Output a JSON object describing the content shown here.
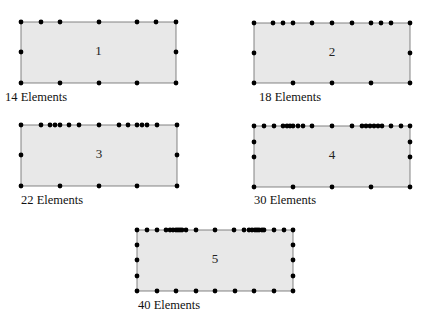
{
  "figure": {
    "panels": [
      {
        "id": 1,
        "label": "1",
        "caption": "14 Elements",
        "element_count": 14,
        "rect": {
          "x": 21,
          "y": 22,
          "w": 155,
          "h": 61
        },
        "caption_pos": {
          "x": 5,
          "y": 92
        },
        "nodes": [
          [
            21,
            22
          ],
          [
            41,
            22
          ],
          [
            60,
            22
          ],
          [
            99,
            22
          ],
          [
            137,
            22
          ],
          [
            156,
            22
          ],
          [
            176,
            22
          ],
          [
            21,
            52
          ],
          [
            176,
            52
          ],
          [
            21,
            83
          ],
          [
            60,
            83
          ],
          [
            99,
            83
          ],
          [
            137,
            83
          ],
          [
            176,
            83
          ]
        ]
      },
      {
        "id": 2,
        "label": "2",
        "caption": "18 Elements",
        "element_count": 18,
        "rect": {
          "x": 254,
          "y": 23,
          "w": 156,
          "h": 60
        },
        "caption_pos": {
          "x": 259,
          "y": 92
        },
        "nodes": [
          [
            254,
            23
          ],
          [
            273,
            23
          ],
          [
            283,
            23
          ],
          [
            293,
            23
          ],
          [
            312,
            23
          ],
          [
            332,
            23
          ],
          [
            352,
            23
          ],
          [
            371,
            23
          ],
          [
            381,
            23
          ],
          [
            391,
            23
          ],
          [
            410,
            23
          ],
          [
            254,
            53
          ],
          [
            410,
            53
          ],
          [
            254,
            83
          ],
          [
            293,
            83
          ],
          [
            332,
            83
          ],
          [
            371,
            83
          ],
          [
            410,
            83
          ]
        ]
      },
      {
        "id": 3,
        "label": "3",
        "caption": "22 Elements",
        "element_count": 22,
        "rect": {
          "x": 21,
          "y": 125,
          "w": 156,
          "h": 61
        },
        "caption_pos": {
          "x": 21,
          "y": 195
        },
        "nodes": [
          [
            21,
            125
          ],
          [
            41,
            125
          ],
          [
            50,
            125
          ],
          [
            55,
            125
          ],
          [
            60,
            125
          ],
          [
            69,
            125
          ],
          [
            79,
            125
          ],
          [
            99,
            125
          ],
          [
            119,
            125
          ],
          [
            128,
            125
          ],
          [
            137,
            125
          ],
          [
            142,
            125
          ],
          [
            147,
            125
          ],
          [
            157,
            125
          ],
          [
            177,
            125
          ],
          [
            21,
            155
          ],
          [
            177,
            155
          ],
          [
            21,
            186
          ],
          [
            60,
            186
          ],
          [
            99,
            186
          ],
          [
            137,
            186
          ],
          [
            177,
            186
          ]
        ]
      },
      {
        "id": 4,
        "label": "4",
        "caption": "30 Elements",
        "element_count": 30,
        "rect": {
          "x": 254,
          "y": 126,
          "w": 156,
          "h": 61
        },
        "caption_pos": {
          "x": 254,
          "y": 195
        },
        "nodes": [
          [
            254,
            126
          ],
          [
            264,
            126
          ],
          [
            274,
            126
          ],
          [
            283,
            126
          ],
          [
            287,
            126
          ],
          [
            290,
            126
          ],
          [
            293,
            126
          ],
          [
            298,
            126
          ],
          [
            303,
            126
          ],
          [
            312,
            126
          ],
          [
            332,
            126
          ],
          [
            352,
            126
          ],
          [
            362,
            126
          ],
          [
            366,
            126
          ],
          [
            370,
            126
          ],
          [
            374,
            126
          ],
          [
            378,
            126
          ],
          [
            382,
            126
          ],
          [
            391,
            126
          ],
          [
            401,
            126
          ],
          [
            410,
            126
          ],
          [
            254,
            142
          ],
          [
            254,
            157
          ],
          [
            410,
            142
          ],
          [
            410,
            157
          ],
          [
            254,
            187
          ],
          [
            293,
            187
          ],
          [
            332,
            187
          ],
          [
            371,
            187
          ],
          [
            410,
            187
          ]
        ]
      },
      {
        "id": 5,
        "label": "5",
        "caption": "40 Elements",
        "element_count": 40,
        "rect": {
          "x": 137,
          "y": 230,
          "w": 156,
          "h": 61
        },
        "caption_pos": {
          "x": 138,
          "y": 300
        },
        "nodes": [
          [
            137,
            230
          ],
          [
            147,
            230
          ],
          [
            157,
            230
          ],
          [
            166,
            230
          ],
          [
            170,
            230
          ],
          [
            173,
            230
          ],
          [
            176,
            230
          ],
          [
            178,
            230
          ],
          [
            180,
            230
          ],
          [
            182,
            230
          ],
          [
            186,
            230
          ],
          [
            196,
            230
          ],
          [
            215,
            230
          ],
          [
            234,
            230
          ],
          [
            244,
            230
          ],
          [
            249,
            230
          ],
          [
            252,
            230
          ],
          [
            255,
            230
          ],
          [
            257,
            230
          ],
          [
            259,
            230
          ],
          [
            262,
            230
          ],
          [
            264,
            230
          ],
          [
            274,
            230
          ],
          [
            284,
            230
          ],
          [
            293,
            230
          ],
          [
            137,
            245
          ],
          [
            137,
            260
          ],
          [
            137,
            276
          ],
          [
            293,
            245
          ],
          [
            293,
            260
          ],
          [
            293,
            276
          ],
          [
            137,
            291
          ],
          [
            157,
            291
          ],
          [
            176,
            291
          ],
          [
            196,
            291
          ],
          [
            215,
            291
          ],
          [
            235,
            291
          ],
          [
            254,
            291
          ],
          [
            274,
            291
          ],
          [
            293,
            291
          ]
        ]
      }
    ]
  }
}
